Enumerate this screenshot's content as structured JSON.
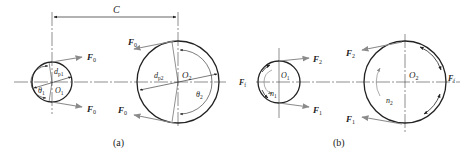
{
  "figure": {
    "panels": [
      {
        "id": "a",
        "caption": "(a)",
        "center_distance_label": "C",
        "small_pulley": {
          "center_label": "O",
          "center_sub": "1",
          "diameter_label": "d",
          "diameter_sub": "p1",
          "angle_label": "θ",
          "angle_sub": "1"
        },
        "large_pulley": {
          "center_label": "O",
          "center_sub": "2",
          "diameter_label": "d",
          "diameter_sub": "p2",
          "angle_label": "θ",
          "angle_sub": "2"
        },
        "forces": {
          "small_top": {
            "label": "F",
            "sub": "0"
          },
          "small_bottom": {
            "label": "F",
            "sub": "0"
          },
          "large_top": {
            "label": "F",
            "sub": "0"
          },
          "large_bottom": {
            "label": "F",
            "sub": "0"
          }
        }
      },
      {
        "id": "b",
        "caption": "(b)",
        "small_pulley": {
          "center_label": "O",
          "center_sub": "1",
          "speed_label": "n",
          "speed_sub": "1",
          "friction_label": "F",
          "friction_sub": "f"
        },
        "large_pulley": {
          "center_label": "O",
          "center_sub": "2",
          "speed_label": "n",
          "speed_sub": "2",
          "friction_label": "F",
          "friction_sub": "f"
        },
        "forces": {
          "small_top": {
            "label": "F",
            "sub": "2"
          },
          "small_bottom": {
            "label": "F",
            "sub": "1"
          },
          "large_top": {
            "label": "F",
            "sub": "2"
          },
          "large_bottom": {
            "label": "F",
            "sub": "1"
          }
        }
      }
    ],
    "colors": {
      "line": "#2a2a2a",
      "force_arrow": "#8a8a8a",
      "text": "#222222"
    }
  }
}
